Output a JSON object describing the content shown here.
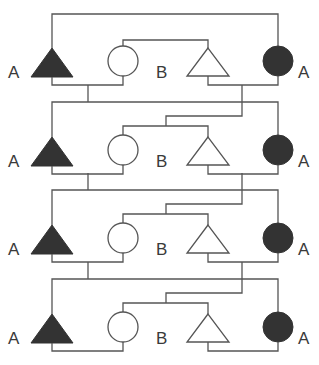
{
  "diagram": {
    "type": "pedigree",
    "generations": 4,
    "colors": {
      "line": "#555555",
      "affected_fill": "#333333",
      "unaffected_fill": "#ffffff",
      "label": "#3a3a3a"
    },
    "generation_rows": [
      {
        "index": 1,
        "members": [
          {
            "shape": "triangle",
            "filled": true,
            "label": "A"
          },
          {
            "shape": "circle",
            "filled": false,
            "label": ""
          },
          {
            "shape": "triangle",
            "filled": false,
            "label": "B"
          },
          {
            "shape": "circle",
            "filled": true,
            "label": "A"
          }
        ]
      },
      {
        "index": 2,
        "members": [
          {
            "shape": "triangle",
            "filled": true,
            "label": "A"
          },
          {
            "shape": "circle",
            "filled": false,
            "label": ""
          },
          {
            "shape": "triangle",
            "filled": false,
            "label": "B"
          },
          {
            "shape": "circle",
            "filled": true,
            "label": "A"
          }
        ]
      },
      {
        "index": 3,
        "members": [
          {
            "shape": "triangle",
            "filled": true,
            "label": "A"
          },
          {
            "shape": "circle",
            "filled": false,
            "label": ""
          },
          {
            "shape": "triangle",
            "filled": false,
            "label": "B"
          },
          {
            "shape": "circle",
            "filled": true,
            "label": "A"
          }
        ]
      },
      {
        "index": 4,
        "members": [
          {
            "shape": "triangle",
            "filled": true,
            "label": "A"
          },
          {
            "shape": "circle",
            "filled": false,
            "label": ""
          },
          {
            "shape": "triangle",
            "filled": false,
            "label": "B"
          },
          {
            "shape": "circle",
            "filled": true,
            "label": "A"
          }
        ]
      }
    ],
    "labels": {
      "g1_left": "A",
      "g1_mid": "B",
      "g1_right": "A",
      "g2_left": "A",
      "g2_mid": "B",
      "g2_right": "A",
      "g3_left": "A",
      "g3_mid": "B",
      "g3_right": "A",
      "g4_left": "A",
      "g4_mid": "B",
      "g4_right": "A"
    }
  }
}
